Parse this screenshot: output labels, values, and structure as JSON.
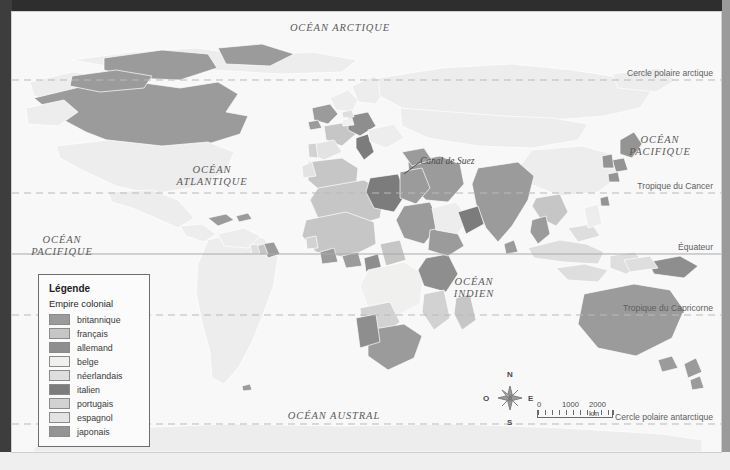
{
  "map": {
    "ocean_labels": [
      {
        "name": "arctic",
        "text": "OCÉAN ARCTIQUE",
        "x": 328,
        "y": 18,
        "lines": [
          "OCÉAN ARCTIQUE"
        ]
      },
      {
        "name": "atlantic",
        "text": "OCÉAN ATLANTIQUE",
        "x": 200,
        "y": 158,
        "lines": [
          "OCÉAN",
          "ATLANTIQUE"
        ]
      },
      {
        "name": "pacific-west",
        "text": "OCÉAN PACIFIQUE",
        "x": 48,
        "y": 228,
        "lines": [
          "OCÉAN",
          "PACIFIQUE"
        ]
      },
      {
        "name": "pacific-east",
        "text": "OCÉAN PACIFIQUE",
        "x": 648,
        "y": 128,
        "lines": [
          "OCÉAN",
          "PACIFIQUE"
        ]
      },
      {
        "name": "indian",
        "text": "OCÉAN INDIEN",
        "x": 462,
        "y": 270,
        "lines": [
          "OCÉAN",
          "INDIEN"
        ]
      },
      {
        "name": "austral",
        "text": "OCÉAN AUSTRAL",
        "x": 322,
        "y": 404,
        "lines": [
          "OCÉAN AUSTRAL"
        ]
      }
    ],
    "latitude_labels": [
      {
        "name": "arctic-circle",
        "text": "Cercle polaire arctique",
        "y": 62
      },
      {
        "name": "tropic-cancer",
        "text": "Tropique du Cancer",
        "y": 173
      },
      {
        "name": "equator",
        "text": "Équateur",
        "y": 236
      },
      {
        "name": "tropic-capricorn",
        "text": "Tropique du Capricorne",
        "y": 296
      },
      {
        "name": "antarctic-circle",
        "text": "Cercle polaire antarctique",
        "y": 406
      }
    ],
    "latitude_line_y": [
      68,
      181,
      242,
      303,
      412
    ],
    "annotation": {
      "text": "Canal de Suez",
      "x": 408,
      "y": 150
    }
  },
  "legend": {
    "title": "Légende",
    "subtitle": "Empire colonial",
    "items": [
      {
        "label": "britannique",
        "color": "#9b9b9b"
      },
      {
        "label": "français",
        "color": "#c6c6c6"
      },
      {
        "label": "allemand",
        "color": "#8e8e8e"
      },
      {
        "label": "belge",
        "color": "#f0f0ee"
      },
      {
        "label": "néerlandais",
        "color": "#dedede"
      },
      {
        "label": "italien",
        "color": "#7c7c7c"
      },
      {
        "label": "portugais",
        "color": "#d2d2d2"
      },
      {
        "label": "espagnol",
        "color": "#e3e3e3"
      },
      {
        "label": "japonais",
        "color": "#949494"
      }
    ]
  },
  "compass": {
    "north": "N",
    "south": "S",
    "east": "E",
    "west": "O"
  },
  "scale": {
    "ticks": [
      "0",
      "1000",
      "2000 km"
    ],
    "unit": "km"
  }
}
